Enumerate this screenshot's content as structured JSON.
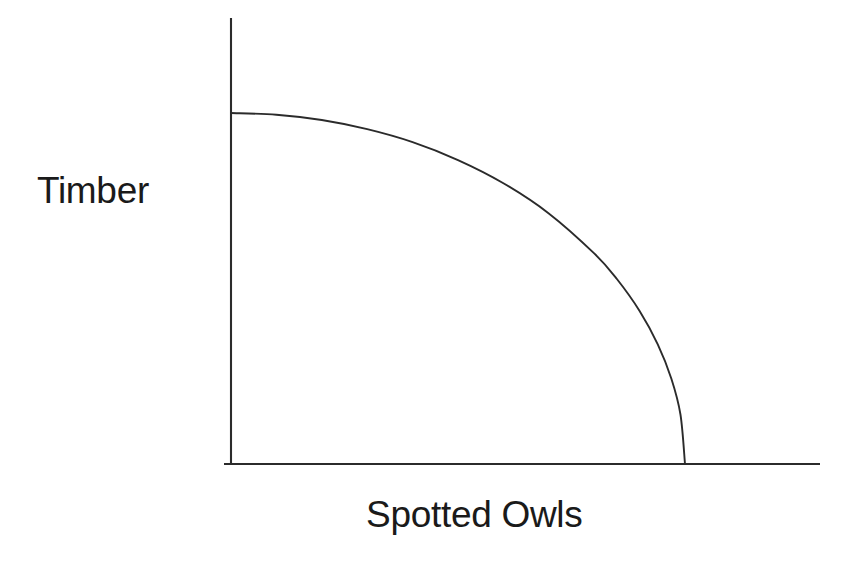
{
  "figure": {
    "background_color": "#ffffff",
    "line_color": "#2b2b2b",
    "text_color": "#1a1a1a"
  },
  "labels": {
    "y_axis": "Timber",
    "x_axis": "Spotted Owls"
  },
  "chart_data": {
    "type": "line",
    "title": "",
    "subtitle": "",
    "xlabel": "Spotted Owls",
    "ylabel": "Timber",
    "xlim": [
      0,
      1.31
    ],
    "ylim": [
      0,
      1.0
    ],
    "grid": false,
    "legend": null,
    "annotations": [],
    "tick_labels": {
      "x": [],
      "y": []
    },
    "series": [
      {
        "name": "Production Possibilities Frontier",
        "curve_shape": "elliptical-quadrant",
        "x": [
          0.0,
          0.1,
          0.2,
          0.3,
          0.4,
          0.5,
          0.6,
          0.7,
          0.8,
          0.85,
          0.9,
          0.94,
          0.97,
          0.99,
          1.0
        ],
        "y": [
          1.0,
          0.995,
          0.98,
          0.954,
          0.917,
          0.866,
          0.8,
          0.714,
          0.6,
          0.527,
          0.436,
          0.341,
          0.243,
          0.141,
          0.0
        ]
      }
    ],
    "axes_geometry": {
      "y_axis_x": 231,
      "y_axis_top_y": 18,
      "y_axis_bottom_y": 464,
      "x_axis_y": 464,
      "x_axis_left_x": 224,
      "x_axis_right_x": 820,
      "curve_start": [
        231,
        113
      ],
      "curve_end": [
        685,
        464
      ]
    }
  }
}
